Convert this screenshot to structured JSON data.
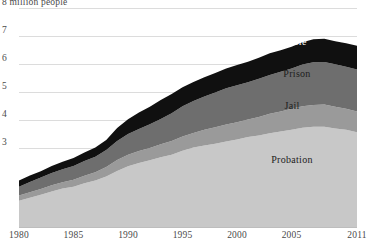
{
  "chart_data": {
    "type": "area",
    "stacked": true,
    "title": "",
    "subtitle": "",
    "xlabel": "",
    "ylabel": "",
    "y_axis_note": "8 million people",
    "grid": true,
    "legend_position": "inline-labels",
    "xlim": [
      1980,
      2011
    ],
    "ylim": [
      0,
      8
    ],
    "ytick_labels": [
      "8 million people",
      "7",
      "6",
      "5",
      "4",
      "3"
    ],
    "ytick_values": [
      8,
      7,
      6,
      5,
      4,
      3
    ],
    "xtick_labels": [
      "1980",
      "1985",
      "1990",
      "1995",
      "2000",
      "2005",
      "2011"
    ],
    "xtick_values": [
      1980,
      1985,
      1990,
      1995,
      2000,
      2005,
      2011
    ],
    "x": [
      1980,
      1981,
      1982,
      1983,
      1984,
      1985,
      1986,
      1987,
      1988,
      1989,
      1990,
      1991,
      1992,
      1993,
      1994,
      1995,
      1996,
      1997,
      1998,
      1999,
      2000,
      2001,
      2002,
      2003,
      2004,
      2005,
      2006,
      2007,
      2008,
      2009,
      2010,
      2011
    ],
    "series": [
      {
        "name": "Probation",
        "color": "#c8c8c8",
        "label_color": "#1d1d1d",
        "values": [
          1.12,
          1.22,
          1.33,
          1.45,
          1.55,
          1.62,
          1.74,
          1.84,
          1.98,
          2.18,
          2.35,
          2.46,
          2.56,
          2.67,
          2.76,
          2.9,
          3.02,
          3.09,
          3.15,
          3.23,
          3.3,
          3.39,
          3.45,
          3.53,
          3.59,
          3.65,
          3.72,
          3.76,
          3.76,
          3.7,
          3.65,
          3.56
        ]
      },
      {
        "name": "Jail",
        "color": "#9a9a9a",
        "label_color": "#1d1d1d",
        "values": [
          0.18,
          0.2,
          0.21,
          0.22,
          0.23,
          0.25,
          0.27,
          0.29,
          0.34,
          0.39,
          0.41,
          0.43,
          0.44,
          0.46,
          0.49,
          0.51,
          0.52,
          0.56,
          0.59,
          0.61,
          0.62,
          0.63,
          0.66,
          0.69,
          0.71,
          0.75,
          0.77,
          0.78,
          0.79,
          0.77,
          0.75,
          0.74
        ]
      },
      {
        "name": "Prison",
        "color": "#6e6e6e",
        "label_color": "#1d1d1d",
        "values": [
          0.32,
          0.37,
          0.41,
          0.44,
          0.46,
          0.49,
          0.53,
          0.56,
          0.61,
          0.68,
          0.74,
          0.79,
          0.85,
          0.91,
          0.99,
          1.08,
          1.14,
          1.19,
          1.24,
          1.29,
          1.32,
          1.33,
          1.36,
          1.39,
          1.42,
          1.44,
          1.49,
          1.52,
          1.52,
          1.52,
          1.5,
          1.5
        ]
      },
      {
        "name": "Parole",
        "color": "#101010",
        "label_color": "#ffffff",
        "values": [
          0.22,
          0.23,
          0.22,
          0.25,
          0.27,
          0.28,
          0.3,
          0.33,
          0.36,
          0.46,
          0.53,
          0.59,
          0.62,
          0.67,
          0.69,
          0.68,
          0.68,
          0.69,
          0.7,
          0.71,
          0.72,
          0.73,
          0.75,
          0.77,
          0.77,
          0.78,
          0.8,
          0.82,
          0.83,
          0.82,
          0.84,
          0.85
        ]
      }
    ],
    "series_label_positions": [
      {
        "name": "Parole",
        "x": 293,
        "y": 41
      },
      {
        "name": "Prison",
        "x": 297,
        "y": 73
      },
      {
        "name": "Jail",
        "x": 292,
        "y": 105
      },
      {
        "name": "Probation",
        "x": 292,
        "y": 159
      }
    ]
  }
}
